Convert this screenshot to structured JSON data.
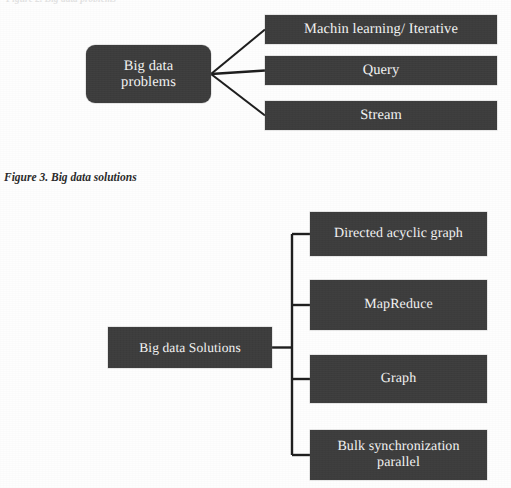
{
  "page": {
    "width": 511,
    "height": 488,
    "background_color": "#fefefe",
    "clipped_header_text": "Figure 2. Big data problems"
  },
  "style": {
    "node_fill_color": "#3d3d3d",
    "node_text_color": "#f4f4f4",
    "connector_color": "#1f1f1f"
  },
  "figure_top": {
    "root": {
      "label": "Big data\nproblems",
      "shape": "rounded-rectangle",
      "x": 86,
      "y": 45,
      "width": 125,
      "height": 58,
      "font_size": 14.5
    },
    "children": [
      {
        "label": "Machin learning/ Iterative",
        "x": 265,
        "y": 15,
        "width": 232,
        "height": 29,
        "font_size": 14.5
      },
      {
        "label": "Query",
        "x": 265,
        "y": 56,
        "width": 232,
        "height": 29,
        "font_size": 14.5
      },
      {
        "label": "Stream",
        "x": 265,
        "y": 101,
        "width": 232,
        "height": 29,
        "font_size": 14.5
      }
    ],
    "connector_style": "radial-fan"
  },
  "caption": {
    "text": "Figure 3. Big data solutions",
    "x": 4,
    "y": 171,
    "font_size": 11.5
  },
  "figure_bottom": {
    "root": {
      "label": "Big data Solutions",
      "shape": "rectangle",
      "x": 108,
      "y": 327,
      "width": 164,
      "height": 41,
      "font_size": 13.5
    },
    "children": [
      {
        "label": "Directed acyclic graph",
        "x": 310,
        "y": 212,
        "width": 177,
        "height": 44,
        "font_size": 14
      },
      {
        "label": "MapReduce",
        "x": 310,
        "y": 280,
        "width": 177,
        "height": 50,
        "font_size": 14
      },
      {
        "label": "Graph",
        "x": 310,
        "y": 355,
        "width": 177,
        "height": 48,
        "font_size": 14
      },
      {
        "label": "Bulk synchronization\nparallel",
        "x": 310,
        "y": 430,
        "width": 177,
        "height": 50,
        "font_size": 14
      }
    ],
    "connector_style": "orthogonal-bracket",
    "spine_x": 292
  }
}
